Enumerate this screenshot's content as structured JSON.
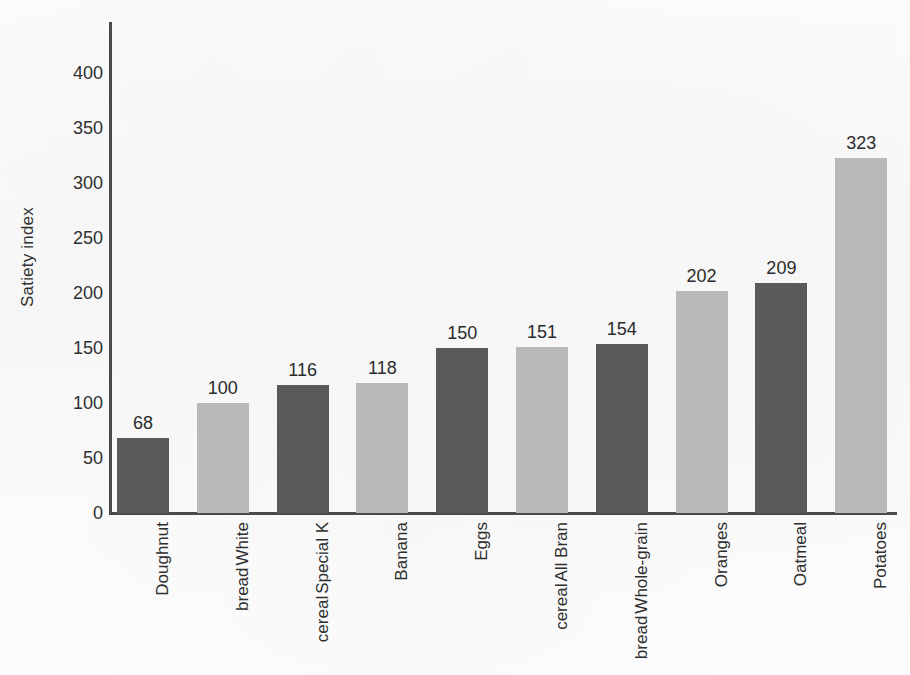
{
  "chart_data": {
    "type": "bar",
    "title": "",
    "xlabel": "",
    "ylabel": "Satiety index",
    "ylim": [
      0,
      430
    ],
    "yticks": [
      0,
      50,
      100,
      150,
      200,
      250,
      300,
      350,
      400
    ],
    "grid": false,
    "legend": "none",
    "categories": [
      "Doughnut",
      "White bread",
      "Special K cereal",
      "Banana",
      "Eggs",
      "All Bran cereal",
      "Whole-grain bread",
      "Oranges",
      "Oatmeal",
      "Potatoes"
    ],
    "category_lines": [
      [
        "Doughnut"
      ],
      [
        "White",
        "bread"
      ],
      [
        "Special K",
        "cereal"
      ],
      [
        "Banana"
      ],
      [
        "Eggs"
      ],
      [
        "All Bran",
        "cereal"
      ],
      [
        "Whole-grain",
        "bread"
      ],
      [
        "Oranges"
      ],
      [
        "Oatmeal"
      ],
      [
        "Potatoes"
      ]
    ],
    "values": [
      68,
      100,
      116,
      118,
      150,
      151,
      154,
      202,
      209,
      323
    ],
    "value_labels": [
      "68",
      "100",
      "116",
      "118",
      "150",
      "151",
      "154",
      "202",
      "209",
      "323"
    ],
    "bar_colors": [
      "#5a5a5a",
      "#b9b9b9",
      "#5a5a5a",
      "#b9b9b9",
      "#5a5a5a",
      "#b9b9b9",
      "#5a5a5a",
      "#b9b9b9",
      "#5a5a5a",
      "#b9b9b9"
    ]
  },
  "colors": {
    "dark_bar": "#5a5a5a",
    "light_bar": "#b9b9b9",
    "axis": "#4a4a4a",
    "text": "#2b2b2b",
    "plot_background": "#f7f7f7",
    "page_background": "#fbfbfb"
  }
}
